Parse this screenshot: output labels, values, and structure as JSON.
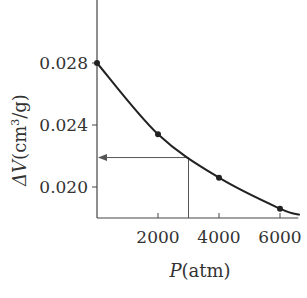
{
  "chart_data": {
    "type": "line",
    "title": "",
    "xlabel": "P(atm)",
    "xlabel_var": "P",
    "xlabel_unit": "(atm)",
    "ylabel": "ΔV(cm³/g)",
    "ylabel_var": "ΔV",
    "ylabel_unit_pre": "(cm",
    "ylabel_unit_sup": "3",
    "ylabel_unit_post": "/g)",
    "xlim": [
      0,
      6600
    ],
    "ylim": [
      0.018,
      0.0322
    ],
    "x_ticks": [
      2000,
      4000,
      6000
    ],
    "x_tick_labels": [
      "2000",
      "4000",
      "6000"
    ],
    "y_ticks": [
      0.02,
      0.024,
      0.028
    ],
    "y_tick_labels": [
      "0.020",
      "0.024",
      "0.028"
    ],
    "grid": false,
    "series": [
      {
        "name": "ΔV vs P",
        "x": [
          0,
          2000,
          4000,
          6000
        ],
        "y": [
          0.028,
          0.0234,
          0.0206,
          0.0186
        ],
        "curve_end": {
          "x": 6650,
          "y": 0.0182
        }
      }
    ],
    "annotations": [
      {
        "type": "guide-line",
        "x": 3000,
        "y": 0.0219,
        "description": "vertical line from P=3000 up to curve, then arrow left to ΔV axis"
      }
    ],
    "colors": {
      "line": "#222222",
      "axis": "#444444",
      "guide": "#555555"
    }
  }
}
